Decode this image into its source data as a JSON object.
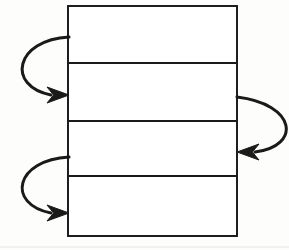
{
  "figure": {
    "kind": "line-diagram",
    "background_color": "#fdfdfb",
    "stroke_color": "#1a1a1a",
    "fill_color": "#ffffff",
    "canvas": {
      "width": 289,
      "height": 250
    }
  },
  "stack": {
    "label": "four-band-rectangle",
    "x": 68,
    "y": 6,
    "width": 169,
    "height": 230,
    "outer_stroke_width": 1.6,
    "divider_stroke_width": 2.2,
    "dividers_y": [
      63,
      121,
      176
    ],
    "bands": [
      {
        "name": "band-1",
        "top": 6,
        "bottom": 63,
        "height": 57
      },
      {
        "name": "band-2",
        "top": 63,
        "bottom": 121,
        "height": 58
      },
      {
        "name": "band-3",
        "top": 121,
        "bottom": 176,
        "height": 55
      },
      {
        "name": "band-4",
        "top": 176,
        "bottom": 236,
        "height": 60
      }
    ]
  },
  "arrows": [
    {
      "name": "feedback-arrow-upper-left",
      "side": "left",
      "stroke_width": 3.0,
      "tail": {
        "x": 69,
        "y": 37
      },
      "control_1": {
        "x": 15,
        "y": 40
      },
      "control_2": {
        "x": 6,
        "y": 86
      },
      "head_tip": {
        "x": 69,
        "y": 95
      },
      "head_length": 22,
      "head_half_width": 8,
      "head_direction": "right"
    },
    {
      "name": "feedback-arrow-lower-left",
      "side": "left",
      "stroke_width": 3.0,
      "tail": {
        "x": 69,
        "y": 157
      },
      "control_1": {
        "x": 15,
        "y": 160
      },
      "control_2": {
        "x": 6,
        "y": 204
      },
      "head_tip": {
        "x": 69,
        "y": 213
      },
      "head_length": 22,
      "head_half_width": 8,
      "head_direction": "right"
    },
    {
      "name": "feedback-arrow-right",
      "side": "right",
      "stroke_width": 3.0,
      "tail": {
        "x": 237,
        "y": 97
      },
      "control_1": {
        "x": 296,
        "y": 104
      },
      "control_2": {
        "x": 302,
        "y": 146
      },
      "head_tip": {
        "x": 237,
        "y": 152
      },
      "head_length": 22,
      "head_half_width": 8,
      "head_direction": "left"
    }
  ],
  "artifacts": [
    {
      "name": "scan-edge-line",
      "x1": 0,
      "y1": 247,
      "x2": 289,
      "y2": 247,
      "color": "#e8e6e2",
      "stroke_width": 1
    }
  ]
}
